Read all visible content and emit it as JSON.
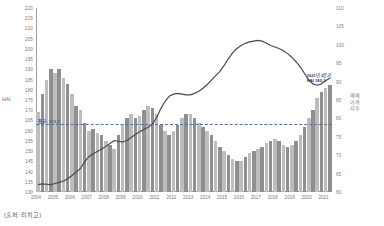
{
  "source_note": "(출처: 리치고)",
  "axes": {
    "left_title": "HAI",
    "right_title": "매매\n가격\n지수",
    "right_title_lines": [
      "매매",
      "가격",
      "지수"
    ],
    "left_ticks": [
      220,
      215,
      210,
      205,
      200,
      195,
      190,
      185,
      180,
      175,
      170,
      165,
      160,
      155,
      150,
      145,
      140,
      135,
      130
    ],
    "right_ticks": [
      110,
      105,
      100,
      95,
      90,
      85,
      80,
      75,
      70,
      65,
      60
    ],
    "x_ticks": [
      2004,
      2005,
      2006,
      2007,
      2008,
      2009,
      2010,
      2011,
      2012,
      2013,
      2014,
      2015,
      2016,
      2017,
      2018,
      2019,
      2020,
      2021
    ]
  },
  "annotations": {
    "average_label": "평균: 163.3",
    "average_value": 163.3,
    "callout_line1": "2021년 2분기",
    "callout_line2": "HAI 182.3"
  },
  "colors": {
    "bar_light": "#bdbdbd",
    "bar_dark": "#8f8f8f",
    "line": "#4a4a4a",
    "avg_line": "#3b5ea8",
    "axis": "#9b9b9b",
    "tick_text": "#7a7a7a"
  },
  "chart_data": {
    "type": "bar",
    "title": "",
    "xlabel": "",
    "ylabel": "HAI",
    "ylim": [
      130,
      220
    ],
    "y2lim": [
      60,
      110
    ],
    "y2label": "매매가격지수",
    "grid": false,
    "legend": "none",
    "x_start_year": 2004,
    "quarters_per_year": 4,
    "categories": [
      "2004Q1",
      "2004Q2",
      "2004Q3",
      "2004Q4",
      "2005Q1",
      "2005Q2",
      "2005Q3",
      "2005Q4",
      "2006Q1",
      "2006Q2",
      "2006Q3",
      "2006Q4",
      "2007Q1",
      "2007Q2",
      "2007Q3",
      "2007Q4",
      "2008Q1",
      "2008Q2",
      "2008Q3",
      "2008Q4",
      "2009Q1",
      "2009Q2",
      "2009Q3",
      "2009Q4",
      "2010Q1",
      "2010Q2",
      "2010Q3",
      "2010Q4",
      "2011Q1",
      "2011Q2",
      "2011Q3",
      "2011Q4",
      "2012Q1",
      "2012Q2",
      "2012Q3",
      "2012Q4",
      "2013Q1",
      "2013Q2",
      "2013Q3",
      "2013Q4",
      "2014Q1",
      "2014Q2",
      "2014Q3",
      "2014Q4",
      "2015Q1",
      "2015Q2",
      "2015Q3",
      "2015Q4",
      "2016Q1",
      "2016Q2",
      "2016Q3",
      "2016Q4",
      "2017Q1",
      "2017Q2",
      "2017Q3",
      "2017Q4",
      "2018Q1",
      "2018Q2",
      "2018Q3",
      "2018Q4",
      "2019Q1",
      "2019Q2",
      "2019Q3",
      "2019Q4",
      "2020Q1",
      "2020Q2",
      "2020Q3",
      "2020Q4",
      "2021Q1",
      "2021Q2"
    ],
    "series": [
      {
        "name": "HAI",
        "type": "bar",
        "axis": "left",
        "values": [
          169,
          178,
          185,
          190,
          188,
          190,
          186,
          183,
          178,
          172,
          170,
          164,
          160,
          161,
          159,
          158,
          155,
          153,
          151,
          158,
          163,
          166,
          168,
          166,
          167,
          170,
          172,
          171,
          168,
          163,
          160,
          158,
          160,
          163,
          166,
          168,
          168,
          166,
          164,
          162,
          160,
          158,
          155,
          152,
          150,
          148,
          146,
          145,
          145,
          147,
          149,
          150,
          151,
          152,
          154,
          155,
          156,
          155,
          153,
          152,
          153,
          155,
          158,
          162,
          166,
          170,
          176,
          179,
          181,
          182.3
        ]
      },
      {
        "name": "매매가격지수",
        "type": "line",
        "axis": "right",
        "values": [
          62.0,
          62.2,
          62.1,
          62.0,
          62.3,
          62.6,
          63.0,
          63.6,
          64.5,
          65.4,
          66.4,
          68.2,
          69.6,
          70.4,
          71.0,
          71.6,
          72.4,
          73.2,
          74.0,
          73.8,
          73.6,
          74.0,
          74.8,
          75.6,
          76.4,
          77.0,
          77.6,
          78.4,
          80.2,
          82.6,
          84.6,
          86.0,
          86.6,
          86.8,
          86.6,
          86.4,
          86.4,
          86.8,
          87.4,
          88.2,
          89.2,
          90.4,
          91.6,
          92.8,
          94.4,
          96.2,
          97.8,
          99.0,
          99.8,
          100.4,
          100.8,
          101.0,
          101.2,
          101.0,
          100.4,
          99.8,
          99.4,
          99.0,
          98.4,
          97.6,
          96.6,
          95.4,
          94.0,
          92.2,
          90.4,
          89.4,
          89.0,
          89.4,
          90.2,
          91.0
        ]
      }
    ]
  }
}
